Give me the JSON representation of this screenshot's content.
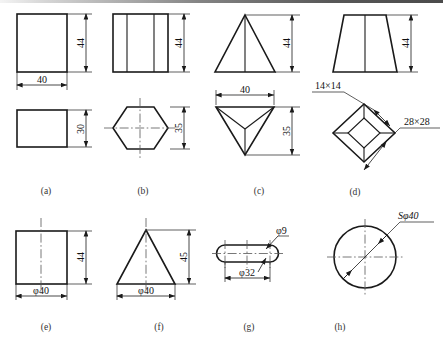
{
  "figure": {
    "page_background": "#ffffff",
    "line_color": "#1a1a1a",
    "rows": 2,
    "columns": 4
  },
  "captions": [
    {
      "id": "a",
      "label": "(a)"
    },
    {
      "id": "b",
      "label": "(b)"
    },
    {
      "id": "c",
      "label": "(c)"
    },
    {
      "id": "d",
      "label": "(d)"
    },
    {
      "id": "e",
      "label": "(e)"
    },
    {
      "id": "f",
      "label": "(f)"
    },
    {
      "id": "g",
      "label": "(g)"
    },
    {
      "id": "h",
      "label": "(h)"
    }
  ],
  "items": [
    {
      "id": "a",
      "name": "rectangular-prism",
      "views": [
        "front-square",
        "top-rectangle"
      ],
      "dimensions": [
        {
          "value": "44",
          "orientation": "vertical",
          "view": "front"
        },
        {
          "value": "40",
          "orientation": "horizontal",
          "view": "front"
        },
        {
          "value": "30",
          "orientation": "vertical",
          "view": "top"
        }
      ]
    },
    {
      "id": "b",
      "name": "hexagonal-prism",
      "views": [
        "front-rectangle-with-edges",
        "top-hexagon"
      ],
      "dimensions": [
        {
          "value": "44",
          "orientation": "vertical",
          "view": "front"
        },
        {
          "value": "35",
          "orientation": "vertical",
          "view": "top"
        }
      ]
    },
    {
      "id": "c",
      "name": "triangular-pyramid",
      "views": [
        "front-triangle",
        "top-inverted-triangle"
      ],
      "dimensions": [
        {
          "value": "44",
          "orientation": "vertical",
          "view": "front"
        },
        {
          "value": "40",
          "orientation": "horizontal",
          "view": "top"
        },
        {
          "value": "35",
          "orientation": "vertical",
          "view": "top"
        }
      ]
    },
    {
      "id": "d",
      "name": "truncated-square-pyramid",
      "views": [
        "front-trapezoid",
        "top-diamond-in-diamond"
      ],
      "dimensions": [
        {
          "value": "44",
          "orientation": "vertical",
          "view": "front"
        },
        {
          "value": "14×14",
          "orientation": "leader",
          "view": "top"
        },
        {
          "value": "28×28",
          "orientation": "leader",
          "view": "top"
        }
      ]
    },
    {
      "id": "e",
      "name": "cylinder",
      "views": [
        "front-rectangle-with-centerline"
      ],
      "dimensions": [
        {
          "value": "44",
          "orientation": "vertical",
          "view": "front"
        },
        {
          "value": "φ40",
          "orientation": "horizontal",
          "view": "front"
        }
      ]
    },
    {
      "id": "f",
      "name": "cone",
      "views": [
        "front-triangle-with-centerline"
      ],
      "dimensions": [
        {
          "value": "45",
          "orientation": "vertical",
          "view": "front"
        },
        {
          "value": "φ40",
          "orientation": "horizontal",
          "view": "front"
        }
      ]
    },
    {
      "id": "g",
      "name": "torus-ring",
      "views": [
        "front-ring-section"
      ],
      "dimensions": [
        {
          "value": "φ9",
          "orientation": "leader",
          "view": "front"
        },
        {
          "value": "φ32",
          "orientation": "horizontal",
          "view": "front"
        }
      ]
    },
    {
      "id": "h",
      "name": "sphere",
      "views": [
        "circle-with-crosshair"
      ],
      "dimensions": [
        {
          "value": "Sφ40",
          "orientation": "leader",
          "view": "front"
        }
      ]
    }
  ],
  "labels": {
    "a_h44": "44",
    "a_w40": "40",
    "a_h30": "30",
    "b_h44": "44",
    "b_h35": "35",
    "c_h44": "44",
    "c_w40": "40",
    "c_h35": "35",
    "d_h44": "44",
    "d_s14": "14×14",
    "d_s28": "28×28",
    "e_h44": "44",
    "e_d40": "φ40",
    "f_h45": "45",
    "f_d40": "φ40",
    "g_d9": "φ9",
    "g_d32": "φ32",
    "h_sd40": "Sφ40"
  }
}
